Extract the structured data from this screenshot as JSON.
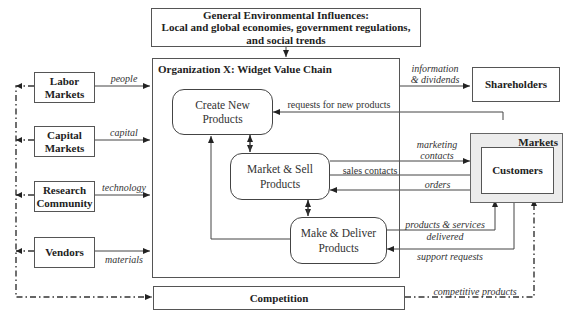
{
  "environment": {
    "title": "General Environmental Influences:",
    "subtitle_line1": "Local and global economies, government regulations,",
    "subtitle_line2": "and social trends"
  },
  "organization": {
    "title": "Organization X:  Widget Value Chain",
    "processes": [
      {
        "line1": "Create New",
        "line2": "Products"
      },
      {
        "line1": "Market & Sell",
        "line2": "Products"
      },
      {
        "line1": "Make & Deliver",
        "line2": "Products"
      }
    ]
  },
  "suppliers": [
    {
      "line1": "Labor",
      "line2": "Markets",
      "flow": "people"
    },
    {
      "line1": "Capital",
      "line2": "Markets",
      "flow": "capital"
    },
    {
      "line1": "Research",
      "line2": "Community",
      "flow": "technology"
    },
    {
      "line1": "Vendors",
      "line2": "",
      "flow": "materials"
    }
  ],
  "shareholders": {
    "label": "Shareholders",
    "flow_line1": "information",
    "flow_line2": "& dividends"
  },
  "markets": {
    "label": "Markets",
    "customers": "Customers"
  },
  "competition": {
    "label": "Competition",
    "flow": "competitive products"
  },
  "flows": {
    "requests": "requests for new products",
    "marketing_line1": "marketing",
    "marketing_line2": "contacts",
    "sales": "sales contacts",
    "orders": "orders",
    "products_line1": "products & services",
    "products_line2": "delivered",
    "support": "support requests"
  }
}
